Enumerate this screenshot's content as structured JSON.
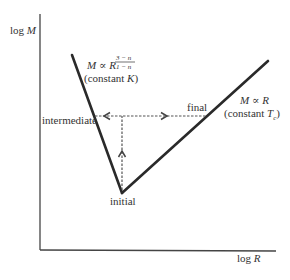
{
  "diagram": {
    "axes": {
      "y_label_prefix": "log ",
      "y_label_var": "M",
      "x_label_prefix": "log ",
      "x_label_var": "R"
    },
    "lines": {
      "steep": {
        "formula_lhs": "M",
        "formula_rel": " ∝ ",
        "formula_base": "R",
        "exponent_num": "3 − n",
        "exponent_den": "1 − n",
        "condition_open": "(constant ",
        "condition_var": "K",
        "condition_close": ")"
      },
      "rising": {
        "formula_lhs": "M",
        "formula_rel": " ∝ ",
        "formula_rhs": "R",
        "condition_open": "(constant ",
        "condition_var": "T",
        "condition_sub": "c",
        "condition_close": ")"
      }
    },
    "points": {
      "initial": "initial",
      "intermediate": "intermediate",
      "final": "final"
    },
    "colors": {
      "line": "#2a2a2a",
      "axis": "#444444",
      "dashed": "#555555",
      "text": "#333333"
    }
  }
}
